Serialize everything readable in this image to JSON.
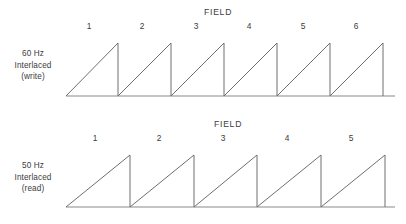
{
  "figure": {
    "line_color": "#6e6e6e",
    "baseline_color": "#8a8a8a",
    "text_color": "#3c3c3c",
    "background": "#ffffff"
  },
  "panels": [
    {
      "id": "write",
      "axis_label_lines": [
        "60 Hz",
        "Interlaced",
        "(write)"
      ],
      "field_title": "FIELD",
      "field_numbers": [
        "1",
        "2",
        "3",
        "4",
        "5",
        "6"
      ]
    },
    {
      "id": "read",
      "axis_label_lines": [
        "50 Hz",
        "Interlaced",
        "(read)"
      ],
      "field_title": "FIELD",
      "field_numbers": [
        "1",
        "2",
        "3",
        "4",
        "5"
      ]
    }
  ],
  "chart_data": {
    "type": "line",
    "xlabel": "",
    "ylabel": "",
    "grid": false,
    "legend": "none",
    "annotations": [
      "FIELD",
      "60 Hz Interlaced (write)",
      "50 Hz Interlaced (read)"
    ],
    "series": [
      {
        "name": "60 Hz Interlaced (write)",
        "waveform": "sawtooth",
        "cycles": 6,
        "field_labels": [
          "1",
          "2",
          "3",
          "4",
          "5",
          "6"
        ],
        "x_start": 66,
        "x_end": 395,
        "baseline_y": 96,
        "peak_y": 43,
        "amplitude_px": 53,
        "period_px": 53.17,
        "ramp_peaks_x": [
          118,
          171,
          224,
          277,
          330,
          383
        ],
        "label_x": [
          89,
          142,
          196,
          249,
          303,
          356
        ],
        "label_y": 25
      },
      {
        "name": "50 Hz Interlaced (read)",
        "waveform": "sawtooth",
        "cycles": 5,
        "field_labels": [
          "1",
          "2",
          "3",
          "4",
          "5"
        ],
        "x_start": 66,
        "x_end": 395,
        "baseline_y": 207,
        "peak_y": 155,
        "amplitude_px": 52,
        "period_px": 63.8,
        "ramp_peaks_x": [
          130,
          194,
          257,
          321,
          385
        ],
        "label_x": [
          95,
          159,
          223,
          287,
          351
        ],
        "label_y": 137
      }
    ]
  }
}
